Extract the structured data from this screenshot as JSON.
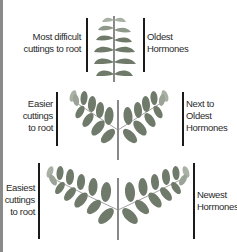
{
  "diagram": {
    "title": "",
    "colors": {
      "leaf": "#6f7a6a",
      "leaf_light": "#a9b1a4",
      "stem": "#3a3a3a",
      "bar": "#1a1a1a",
      "text": "#2a2a2a"
    },
    "rows": [
      {
        "id": "top",
        "plant": "single upright stem with alternating leaves",
        "left_label": [
          "Most difficult",
          "cuttings to root"
        ],
        "right_label": [
          "Oldest",
          "Hormones"
        ]
      },
      {
        "id": "middle",
        "plant": "two compound leaves branching from stem",
        "left_label": [
          "Easier",
          "cuttings",
          "to root"
        ],
        "right_label": [
          "Next to",
          "Oldest",
          "Hormones"
        ]
      },
      {
        "id": "bottom",
        "plant": "two wide compound leaves branching from stem",
        "left_label": [
          "Easiest",
          "cuttings",
          "to root"
        ],
        "right_label": [
          "Newest",
          "Hormones"
        ]
      }
    ]
  }
}
